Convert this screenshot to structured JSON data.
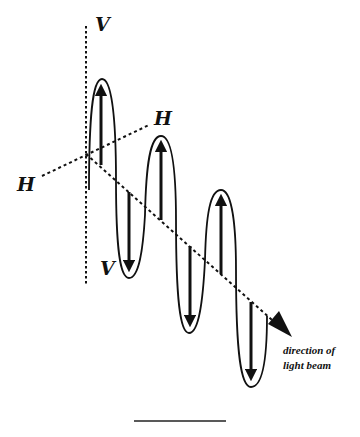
{
  "diagram": {
    "type": "polarized light wave illustration",
    "labels": {
      "v_top": "V",
      "v_bottom": "V",
      "h_left": "H",
      "h_right": "H",
      "direction_line1": "direction of",
      "direction_line2": "light beam"
    },
    "colors": {
      "ink": "#111111",
      "background": "#ffffff"
    },
    "axes": {
      "vertical": "V-V (dotted)",
      "horizontal": "H-H (dotted)",
      "beam": "dotted line with arrowhead toward direction of light beam"
    },
    "lobes": [
      {
        "direction": "up",
        "index": 1
      },
      {
        "direction": "down",
        "index": 1
      },
      {
        "direction": "up",
        "index": 2
      },
      {
        "direction": "down",
        "index": 2
      },
      {
        "direction": "up",
        "index": 3
      },
      {
        "direction": "down",
        "index": 3
      }
    ]
  }
}
